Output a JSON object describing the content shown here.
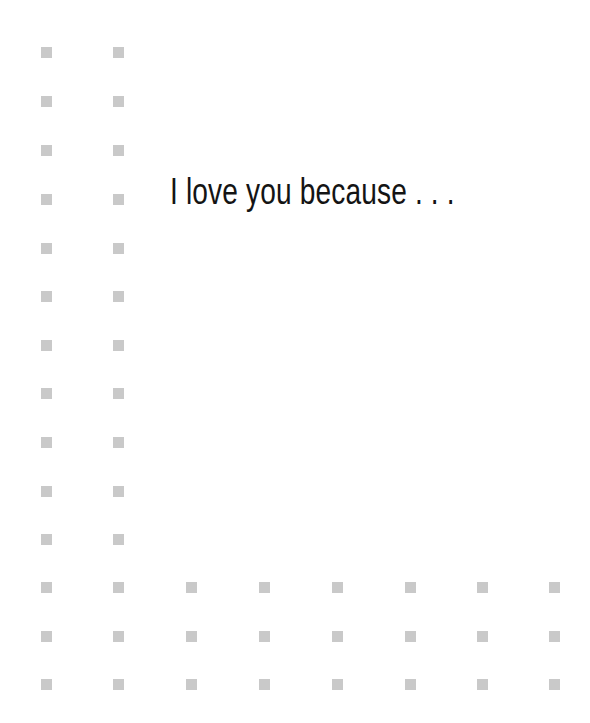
{
  "card": {
    "headline": "I love you because . . .",
    "text_color": "#141414",
    "background_color": "#ffffff"
  },
  "dot_grid": {
    "dot_color": "#c9c9c9",
    "dot_size": 11,
    "column_x": [
      41,
      113,
      186,
      259,
      332,
      405,
      477,
      549
    ],
    "row_y": [
      47,
      96,
      145,
      194,
      243,
      291,
      340,
      388,
      437,
      486,
      534,
      582,
      631,
      679
    ],
    "left_columns_count": 2,
    "full_rows_from_index": 11
  }
}
